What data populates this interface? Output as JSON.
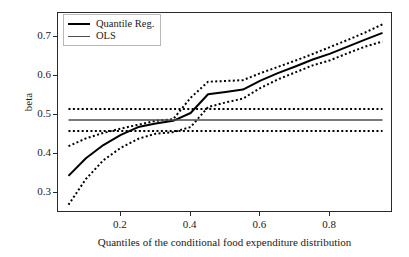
{
  "chart_data": {
    "type": "line",
    "title": "",
    "xlabel": "Quantiles of the conditional food expenditure distribution",
    "ylabel": "beta",
    "xlim": [
      0.02,
      0.98
    ],
    "ylim": [
      0.25,
      0.762
    ],
    "grid": false,
    "legend_position": "upper left",
    "xticks": [
      0.2,
      0.4,
      0.6,
      0.8
    ],
    "xticklabels": [
      "0.2",
      "0.4",
      "0.6",
      "0.8"
    ],
    "yticks": [
      0.3,
      0.4,
      0.5,
      0.6,
      0.7
    ],
    "yticklabels": [
      "0.3",
      "0.4",
      "0.5",
      "0.6",
      "0.7"
    ],
    "x": [
      0.05,
      0.1,
      0.15,
      0.2,
      0.25,
      0.3,
      0.35,
      0.4,
      0.45,
      0.5,
      0.55,
      0.6,
      0.65,
      0.7,
      0.75,
      0.8,
      0.85,
      0.9,
      0.95
    ],
    "series": [
      {
        "name": "Quantile Reg.",
        "style": "solid",
        "color": "#000000",
        "values": [
          0.345,
          0.39,
          0.424,
          0.45,
          0.47,
          0.479,
          0.486,
          0.506,
          0.554,
          0.56,
          0.566,
          0.589,
          0.608,
          0.625,
          0.643,
          0.658,
          0.676,
          0.694,
          0.711
        ]
      },
      {
        "name": "Quantile Reg. upper CI",
        "style": "dotted",
        "color": "#000000",
        "values": [
          0.421,
          0.441,
          0.455,
          0.466,
          0.476,
          0.486,
          0.49,
          0.545,
          0.586,
          0.588,
          0.59,
          0.608,
          0.624,
          0.64,
          0.657,
          0.675,
          0.693,
          0.712,
          0.733
        ]
      },
      {
        "name": "Quantile Reg. lower CI",
        "style": "dotted",
        "color": "#000000",
        "values": [
          0.271,
          0.337,
          0.385,
          0.417,
          0.44,
          0.453,
          0.457,
          0.47,
          0.521,
          0.533,
          0.543,
          0.57,
          0.592,
          0.61,
          0.628,
          0.641,
          0.659,
          0.676,
          0.689
        ]
      },
      {
        "name": "OLS",
        "style": "solid",
        "color": "#4d4d4d",
        "values": [
          0.488,
          0.488,
          0.488,
          0.488,
          0.488,
          0.488,
          0.488,
          0.488,
          0.488,
          0.488,
          0.488,
          0.488,
          0.488,
          0.488,
          0.488,
          0.488,
          0.488,
          0.488,
          0.488
        ]
      },
      {
        "name": "OLS upper CI",
        "style": "dotted",
        "color": "#000000",
        "values": [
          0.516,
          0.516,
          0.516,
          0.516,
          0.516,
          0.516,
          0.516,
          0.516,
          0.516,
          0.516,
          0.516,
          0.516,
          0.516,
          0.516,
          0.516,
          0.516,
          0.516,
          0.516,
          0.516
        ]
      },
      {
        "name": "OLS lower CI",
        "style": "dotted",
        "color": "#000000",
        "values": [
          0.46,
          0.46,
          0.46,
          0.46,
          0.46,
          0.46,
          0.46,
          0.46,
          0.46,
          0.46,
          0.46,
          0.46,
          0.46,
          0.46,
          0.46,
          0.46,
          0.46,
          0.46,
          0.46
        ]
      }
    ],
    "legend": [
      {
        "label": "Quantile Reg.",
        "color": "#000000",
        "width": 2.4
      },
      {
        "label": "OLS",
        "color": "#4d4d4d",
        "width": 1.6
      }
    ]
  }
}
